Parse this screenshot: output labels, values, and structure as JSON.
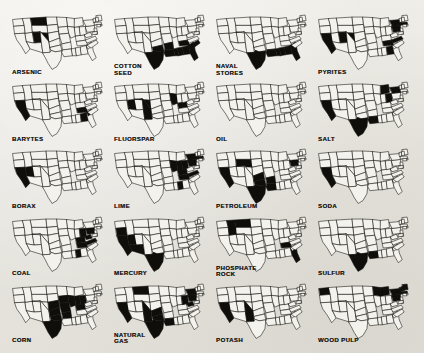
{
  "document": {
    "kind": "figure",
    "layout": "4-column by 5-row grid of United States outline maps",
    "map_style": "black-filled producing states on white US outline",
    "colors": {
      "paper": "#e9e7e1",
      "ink": "#100e0b",
      "state_fill": "#f4f2ec"
    },
    "grid": {
      "columns": 4,
      "rows": 5,
      "count": 20
    }
  },
  "maps": [
    {
      "id": "arsenic",
      "label": "ARSENIC",
      "label_lines": "ARSENIC",
      "shaded_states": [
        "MT",
        "UT",
        "CO"
      ],
      "region_note": "northern Rockies and central Rockies"
    },
    {
      "id": "cotton-seed",
      "label": "COTTON SEED",
      "label_lines": "COTTON\nSEED",
      "shaded_states": [
        "TX",
        "OK",
        "AR",
        "LA",
        "MS",
        "AL",
        "GA",
        "SC",
        "NC",
        "TN",
        "FL"
      ],
      "region_note": "entire Cotton Belt South"
    },
    {
      "id": "naval-stores",
      "label": "NAVAL STORES",
      "label_lines": "NAVAL\nSTORES",
      "shaded_states": [
        "TX",
        "LA",
        "MS",
        "AL",
        "GA",
        "FL",
        "SC"
      ],
      "region_note": "Gulf Coast and southeastern pine belt"
    },
    {
      "id": "pyrites",
      "label": "PYRITES",
      "label_lines": "PYRITES",
      "shaded_states": [
        "CA",
        "UT",
        "CO",
        "TN",
        "GA",
        "VA",
        "NY",
        "PA",
        "MA"
      ],
      "region_note": "California, central Rockies, southern Appalachians, Northeast"
    },
    {
      "id": "barytes",
      "label": "BARYTES",
      "label_lines": "BARYTES",
      "shaded_states": [
        "CA",
        "TN",
        "GA",
        "SC"
      ],
      "region_note": "California and southern Appalachians"
    },
    {
      "id": "fluorspar",
      "label": "FLUORSPAR",
      "label_lines": "FLUORSPAR",
      "shaded_states": [
        "NV",
        "CO",
        "NM",
        "IL",
        "KY"
      ],
      "region_note": "Nevada, Colorado New Mexico, Illinois Kentucky district"
    },
    {
      "id": "oil",
      "label": "OIL",
      "label_lines": "OIL",
      "shaded_states": [],
      "region_note": "no states filled"
    },
    {
      "id": "salt",
      "label": "SALT",
      "label_lines": "SALT",
      "shaded_states": [
        "CA",
        "TX",
        "LA",
        "MI",
        "OH",
        "NY"
      ],
      "region_note": "California, Gulf Coast, Great Lakes, New York"
    },
    {
      "id": "borax",
      "label": "BORAX",
      "label_lines": "BORAX",
      "shaded_states": [
        "CA",
        "NV"
      ],
      "region_note": "California and Nevada desert basins"
    },
    {
      "id": "lime",
      "label": "LIME",
      "label_lines": "LIME",
      "shaded_states": [
        "IL",
        "IN",
        "OH",
        "KY",
        "TN",
        "PA",
        "NY",
        "MA",
        "VA",
        "AL"
      ],
      "region_note": "Ohio Valley and Northeast"
    },
    {
      "id": "petroleum",
      "label": "PETROLEUM",
      "label_lines": "PETROLEUM",
      "shaded_states": [
        "CA",
        "WY",
        "OK",
        "TX",
        "KS",
        "LA",
        "AR",
        "PA"
      ],
      "region_note": "California, Wyoming, Mid-Continent, Pennsylvania"
    },
    {
      "id": "soda",
      "label": "SODA",
      "label_lines": "SODA",
      "shaded_states": [
        "CA"
      ],
      "region_note": "California"
    },
    {
      "id": "coal",
      "label": "COAL",
      "label_lines": "COAL",
      "shaded_states": [
        "PA",
        "WV",
        "OH",
        "KY",
        "TN",
        "AL",
        "VA"
      ],
      "region_note": "Appalachian coal belt"
    },
    {
      "id": "mercury",
      "label": "MERCURY",
      "label_lines": "MERCURY",
      "shaded_states": [
        "CA",
        "NV",
        "OR",
        "AZ",
        "TX"
      ],
      "region_note": "Pacific and southwestern quicksilver districts"
    },
    {
      "id": "phosphate-rock",
      "label": "PHOSPHATE ROCK",
      "label_lines": "PHOSPHATE\nROCK",
      "shaded_states": [
        "ID",
        "MT",
        "TN",
        "FL"
      ],
      "region_note": "western phosphate field, Tennessee, Florida"
    },
    {
      "id": "sulfur",
      "label": "SULFUR",
      "label_lines": "SULFUR",
      "shaded_states": [
        "TX",
        "LA"
      ],
      "region_note": "Gulf Coast salt domes"
    },
    {
      "id": "corn",
      "label": "CORN",
      "label_lines": "CORN",
      "shaded_states": [
        "IA",
        "IL",
        "MO",
        "IN",
        "NE",
        "KS",
        "OK",
        "TX",
        "AR",
        "KY",
        "OH"
      ],
      "region_note": "Corn Belt through the southern plains"
    },
    {
      "id": "natural-gas",
      "label": "NATURAL GAS",
      "label_lines": "NATURAL\nGAS",
      "shaded_states": [
        "CA",
        "TX",
        "OK",
        "LA",
        "KS",
        "WV",
        "PA",
        "OH",
        "NY",
        "MT",
        "NM"
      ],
      "region_note": "California, Mid-Continent, Gulf Coast, Appalachia"
    },
    {
      "id": "potash",
      "label": "POTASH",
      "label_lines": "POTASH",
      "shaded_states": [
        "CA",
        "NM"
      ],
      "region_note": "California and New Mexico"
    },
    {
      "id": "wood-pulp",
      "label": "WOOD PULP",
      "label_lines": "WOOD PULP",
      "shaded_states": [
        "WA",
        "WI",
        "MI",
        "NY",
        "ME",
        "NH",
        "VT",
        "MA",
        "PA"
      ],
      "region_note": "Pacific Northwest, Lake States, Northeast"
    }
  ]
}
